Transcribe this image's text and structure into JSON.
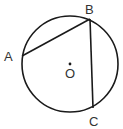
{
  "diagram": {
    "type": "circle-geometry",
    "circle": {
      "center": "O",
      "cx": 70,
      "cy": 64,
      "r": 48,
      "stroke": "#1a1a1a"
    },
    "points": [
      {
        "name": "A",
        "x": 22,
        "y": 56,
        "label": "A",
        "label_x": 4,
        "label_y": 61
      },
      {
        "name": "B",
        "x": 90,
        "y": 19,
        "label": "B",
        "label_x": 85,
        "label_y": 14
      },
      {
        "name": "C",
        "x": 93,
        "y": 108,
        "label": "C",
        "label_x": 89,
        "label_y": 126
      },
      {
        "name": "O",
        "x": 70,
        "y": 64,
        "label": "O",
        "label_x": 65,
        "label_y": 78
      }
    ],
    "segments": [
      {
        "from": "A",
        "to": "B"
      },
      {
        "from": "B",
        "to": "C"
      }
    ]
  }
}
